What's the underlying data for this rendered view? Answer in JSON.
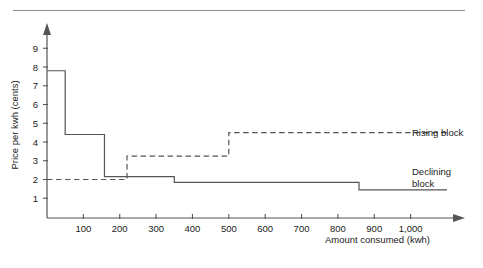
{
  "figure": {
    "top_rule": "horizontal-rule",
    "background_color": "#ffffff",
    "line_color": "#555555"
  },
  "chart_data": {
    "type": "line",
    "title": "",
    "subtitle": "",
    "xlabel": "Amount consumed (kwh)",
    "ylabel": "Price per kwh (cents)",
    "xlim": [
      0,
      1100
    ],
    "ylim": [
      0,
      9.6
    ],
    "grid": false,
    "legend_position": "right",
    "xticks": [
      100,
      200,
      300,
      400,
      500,
      600,
      700,
      800,
      900,
      1000
    ],
    "xticklabels": [
      "100",
      "200",
      "300",
      "400",
      "500",
      "600",
      "700",
      "800",
      "900",
      "1,000"
    ],
    "yticks": [
      1,
      2,
      3,
      4,
      5,
      6,
      7,
      8,
      9
    ],
    "yticklabels": [
      "1",
      "2",
      "3",
      "4",
      "5",
      "6",
      "7",
      "8",
      "9"
    ],
    "series": [
      {
        "name": "Declining block",
        "style": "solid",
        "step_edges": [
          0,
          50,
          158,
          350,
          858,
          1100
        ],
        "values": [
          7.8,
          4.4,
          2.15,
          1.85,
          1.45
        ]
      },
      {
        "name": "Rising block",
        "style": "dashed",
        "step_edges": [
          0,
          220,
          500,
          1100
        ],
        "values": [
          2.0,
          3.25,
          4.5
        ]
      }
    ],
    "annotations": [
      {
        "text": "Rising block",
        "x": 1120,
        "y": 4.5
      },
      {
        "text": "Declining",
        "x": 1120,
        "y": 2.55
      },
      {
        "text": "block",
        "x": 1120,
        "y": 2.05
      }
    ]
  },
  "legend": {
    "rising_label": "Rising block",
    "declining_label_line1": "Declining",
    "declining_label_line2": "block"
  },
  "axes": {
    "x_title": "Amount consumed (kwh)",
    "y_title": "Price per kwh (cents)"
  }
}
